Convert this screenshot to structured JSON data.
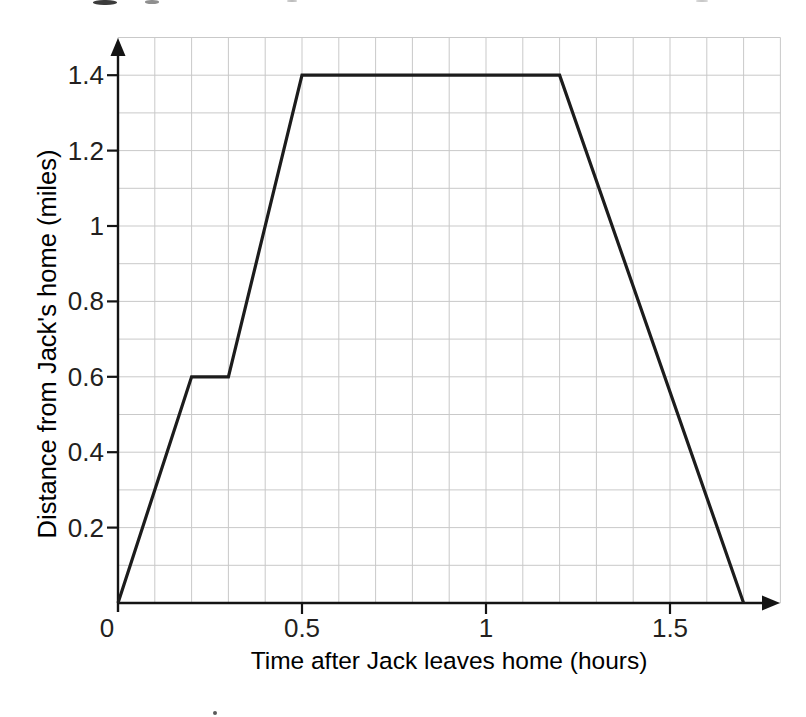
{
  "page": {
    "background": "#ffffff"
  },
  "chart_data": {
    "type": "line",
    "title": "",
    "xlabel": "Time after Jack leaves home (hours)",
    "ylabel": "Distance from Jack's home (miles)",
    "xlim": [
      0,
      1.8
    ],
    "ylim": [
      0,
      1.5
    ],
    "grid": true,
    "grid_step": {
      "x": 0.1,
      "y": 0.1
    },
    "x_ticks": [
      {
        "value": 0,
        "label": "0"
      },
      {
        "value": 0.5,
        "label": "0.5"
      },
      {
        "value": 1,
        "label": "1"
      },
      {
        "value": 1.5,
        "label": "1.5"
      }
    ],
    "y_ticks": [
      {
        "value": 0.2,
        "label": "0.2"
      },
      {
        "value": 0.4,
        "label": "0.4"
      },
      {
        "value": 0.6,
        "label": "0.6"
      },
      {
        "value": 0.8,
        "label": "0.8"
      },
      {
        "value": 1,
        "label": "1"
      },
      {
        "value": 1.2,
        "label": "1.2"
      },
      {
        "value": 1.4,
        "label": "1.4"
      }
    ],
    "series": [
      {
        "name": "journey-line",
        "points": [
          [
            0,
            0
          ],
          [
            0.2,
            0.6
          ],
          [
            0.3,
            0.6
          ],
          [
            0.5,
            1.4
          ],
          [
            1.2,
            1.4
          ],
          [
            1.7,
            0
          ]
        ]
      }
    ],
    "colors": {
      "line": "#1c1c1c",
      "axis": "#141414",
      "grid": "#c9c9c9",
      "text": "#231f20"
    }
  }
}
